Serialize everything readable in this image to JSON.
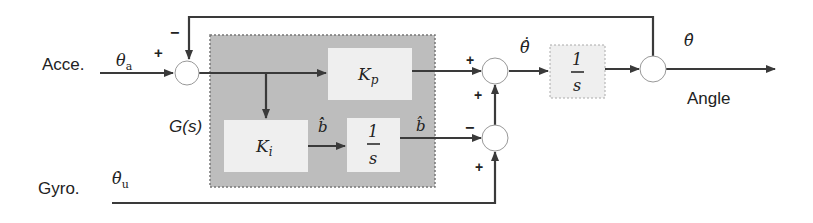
{
  "diagram": {
    "type": "block-diagram",
    "inputs": {
      "acce_label": "Acce.",
      "acce_signal": "θ",
      "acce_signal_sub": "a",
      "gyro_label": "Gyro.",
      "gyro_signal": "θ̇",
      "gyro_signal_sub": "u"
    },
    "output": {
      "label": "Angle",
      "signal": "θ̂"
    },
    "controller": {
      "label": "G(s)",
      "kp": {
        "main": "K",
        "sub": "p"
      },
      "ki": {
        "main": "K",
        "sub": "i"
      },
      "integrator_num": "1",
      "integrator_den": "s",
      "bias_rate": "b̂̇",
      "bias": "b̂"
    },
    "integrator": {
      "num": "1",
      "den": "s"
    },
    "intermediate": {
      "theta_dot_hat": "θ̂̇"
    },
    "signs": {
      "sum1_in": "+",
      "sum1_fb": "−",
      "sum2_top": "+",
      "sum2_bottom": "+",
      "sum3_left": "−",
      "sum3_bottom": "+"
    },
    "colors": {
      "line": "#3a3a3a",
      "controller_fill": "#bdbdbd",
      "block_fill": "#efefef",
      "background": "#ffffff"
    }
  }
}
